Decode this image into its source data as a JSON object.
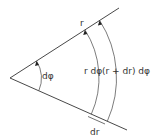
{
  "diagram": {
    "labels": {
      "radius": "r",
      "small_angle": "dφ",
      "inner_arc": "r dφ",
      "outer_arc": "(r + dr) dφ",
      "radial_increment": "dr"
    },
    "colors": {
      "line": "#333333",
      "background": "#ffffff"
    }
  }
}
